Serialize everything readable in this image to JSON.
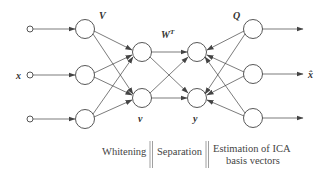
{
  "diagram": {
    "labels": {
      "input": "x",
      "whitening_matrix": "V",
      "whitened_signal": "v",
      "separation_matrix": "W",
      "separation_matrix_sup": "T",
      "separated_signal": "y",
      "basis_matrix": "Q",
      "output": "x̂"
    },
    "stages": [
      {
        "name": "whitening",
        "label": "Whitening"
      },
      {
        "name": "separation",
        "label": "Separation"
      },
      {
        "name": "estimation",
        "label_line1": "Estimation of ICA",
        "label_line2": "basis vectors"
      }
    ],
    "layers": {
      "input_nodes": 3,
      "whitening_nodes": 3,
      "v_nodes": 2,
      "y_nodes": 2,
      "q_nodes": 3,
      "outputs": 3
    },
    "colors": {
      "stroke": "#444444",
      "text": "#333333",
      "divider": "#888888"
    }
  }
}
